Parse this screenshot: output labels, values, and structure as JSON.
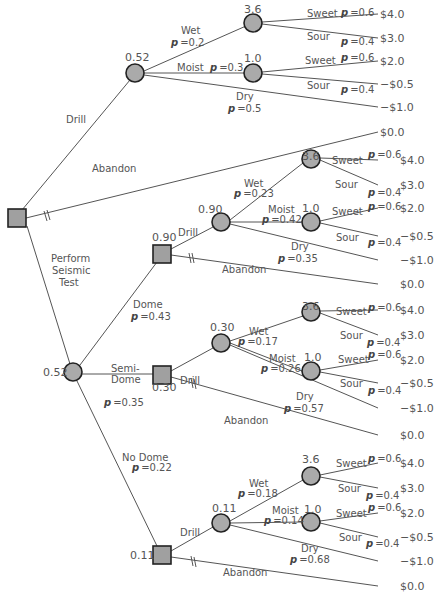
{
  "root": {
    "type": "decision"
  },
  "branches": {
    "drill": "Drill",
    "abandon": "Abandon",
    "perform_seismic": [
      "Perform",
      "Seismic",
      "Test"
    ]
  },
  "no_test": {
    "chance_value": "0.52",
    "wet": {
      "label": "Wet",
      "p": "=0.2",
      "node_value": "3.6"
    },
    "moist": {
      "label": "Moist",
      "p": "=0.3",
      "node_value": "1.0"
    },
    "dry": {
      "label": "Dry",
      "p": "=0.5"
    },
    "sweet": {
      "label": "Sweet",
      "p": "=0.6"
    },
    "sour": {
      "label": "Sour",
      "p": "=0.4"
    },
    "payoffs": [
      "$4.0",
      "$3.0",
      "$2.0",
      "−$0.5",
      "−$1.0"
    ],
    "abandon_payoff": "$0.0"
  },
  "seismic": {
    "chance_value": "0.52",
    "dome": {
      "label": "Dome",
      "p": "=0.43",
      "decision_value": "0.90",
      "chance_value": "0.90",
      "wet": {
        "label": "Wet",
        "p": "=0.23",
        "node_value": "3.6"
      },
      "moist": {
        "label": "Moist",
        "p": "=0.42",
        "node_value": "1.0"
      },
      "dry": {
        "label": "Dry",
        "p": "=0.35"
      },
      "payoffs": [
        "$4.0",
        "$3.0",
        "$2.0",
        "−$0.5",
        "−$1.0"
      ],
      "abandon_payoff": "$0.0"
    },
    "semi_dome": {
      "label": [
        "Semi-",
        "Dome"
      ],
      "p": "=0.35",
      "decision_value": "0.30",
      "chance_value": "0.30",
      "wet": {
        "label": "Wet",
        "p": "=0.17",
        "node_value": "3.6"
      },
      "moist": {
        "label": "Moist",
        "p": "=0.26",
        "node_value": "1.0"
      },
      "dry": {
        "label": "Dry",
        "p": "=0.57"
      },
      "payoffs": [
        "$4.0",
        "$3.0",
        "$2.0",
        "−$0.5",
        "−$1.0"
      ],
      "abandon_payoff": "$0.0"
    },
    "no_dome": {
      "label": "No Dome",
      "p": "=0.22",
      "decision_value": "0.11",
      "chance_value": "0.11",
      "wet": {
        "label": "Wet",
        "p": "=0.18",
        "node_value": "3.6"
      },
      "moist": {
        "label": "Moist",
        "p": "=0.14",
        "node_value": "1.0"
      },
      "dry": {
        "label": "Dry",
        "p": "=0.68"
      },
      "payoffs": [
        "$4.0",
        "$3.0",
        "$2.0",
        "−$0.5",
        "−$1.0"
      ],
      "abandon_payoff": "$0.0"
    }
  },
  "p_symbol": "p",
  "sweet_label": "Sweet",
  "sour_label": "Sour",
  "sweet_p": "=0.6",
  "sour_p": "=0.4",
  "colors": {
    "node_fill": "#aaaaaa",
    "node_stroke": "#222222",
    "line": "#555555",
    "text": "#555555"
  }
}
